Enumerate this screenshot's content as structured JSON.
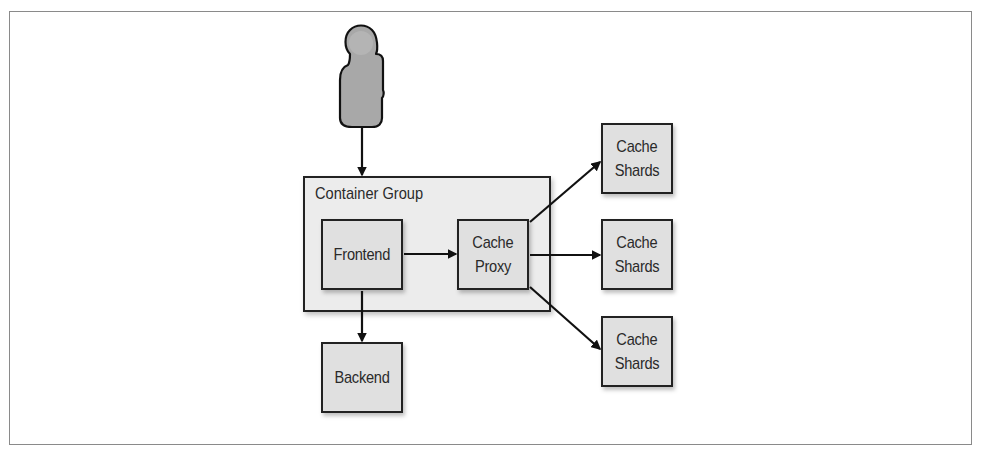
{
  "diagram": {
    "actor": {
      "name": "user",
      "label": ""
    },
    "group": {
      "label": "Container Group"
    },
    "nodes": {
      "frontend": {
        "label": "Frontend"
      },
      "cache_proxy": {
        "line1": "Cache",
        "line2": "Proxy"
      },
      "backend": {
        "label": "Backend"
      },
      "shards": [
        {
          "line1": "Cache",
          "line2": "Shards"
        },
        {
          "line1": "Cache",
          "line2": "Shards"
        },
        {
          "line1": "Cache",
          "line2": "Shards"
        }
      ]
    },
    "edges": [
      {
        "from": "user",
        "to": "container-group"
      },
      {
        "from": "frontend",
        "to": "cache-proxy"
      },
      {
        "from": "frontend",
        "to": "backend"
      },
      {
        "from": "cache-proxy",
        "to": "cache-shards-1"
      },
      {
        "from": "cache-proxy",
        "to": "cache-shards-2"
      },
      {
        "from": "cache-proxy",
        "to": "cache-shards-3"
      }
    ],
    "colors": {
      "stroke": "#222222",
      "box_fill": "#e0e0e0",
      "group_fill": "#ececec",
      "actor_fill": "#a8a8a8"
    }
  }
}
